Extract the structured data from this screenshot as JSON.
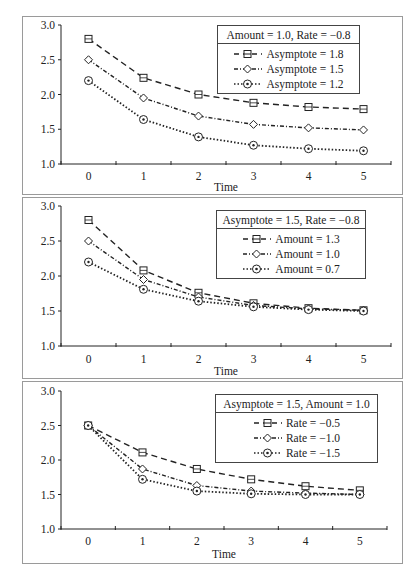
{
  "chart_data": [
    {
      "type": "line",
      "title": "",
      "legend_title": "Amount = 1.0, Rate = −0.8",
      "xlabel": "Time",
      "ylabel": "",
      "x": [
        0,
        1,
        2,
        3,
        4,
        5
      ],
      "ylim": [
        1.0,
        3.0
      ],
      "yticks": [
        "1.0",
        "1.5",
        "2.0",
        "2.5",
        "3.0"
      ],
      "grid": false,
      "legend_position": "upper right",
      "series": [
        {
          "name": "Asymptote = 1.8",
          "marker": "square",
          "dash": "dashed",
          "values": [
            2.8,
            2.24,
            2.0,
            1.88,
            1.82,
            1.79
          ]
        },
        {
          "name": "Asymptote = 1.5",
          "marker": "diamond",
          "dash": "dash-dot",
          "values": [
            2.5,
            1.95,
            1.69,
            1.57,
            1.52,
            1.49
          ]
        },
        {
          "name": "Asymptote = 1.2",
          "marker": "circle",
          "dash": "dotted",
          "values": [
            2.2,
            1.64,
            1.39,
            1.27,
            1.22,
            1.19
          ]
        }
      ]
    },
    {
      "type": "line",
      "title": "",
      "legend_title": "Asymptote = 1.5, Rate = −0.8",
      "xlabel": "Time",
      "ylabel": "",
      "x": [
        0,
        1,
        2,
        3,
        4,
        5
      ],
      "ylim": [
        1.0,
        3.0
      ],
      "yticks": [
        "1.0",
        "1.5",
        "2.0",
        "2.5",
        "3.0"
      ],
      "grid": false,
      "legend_position": "upper right",
      "series": [
        {
          "name": "Amount = 1.3",
          "marker": "square",
          "dash": "dashed",
          "values": [
            2.8,
            2.08,
            1.76,
            1.61,
            1.54,
            1.51
          ]
        },
        {
          "name": "Amount = 1.0",
          "marker": "diamond",
          "dash": "dash-dot",
          "values": [
            2.5,
            1.95,
            1.7,
            1.58,
            1.53,
            1.51
          ]
        },
        {
          "name": "Amount = 0.7",
          "marker": "circle",
          "dash": "dotted",
          "values": [
            2.2,
            1.81,
            1.64,
            1.56,
            1.52,
            1.5
          ]
        }
      ]
    },
    {
      "type": "line",
      "title": "",
      "legend_title": "Asymptote = 1.5, Amount = 1.0",
      "xlabel": "Time",
      "ylabel": "",
      "x": [
        0,
        1,
        2,
        3,
        4,
        5
      ],
      "ylim": [
        1.0,
        3.0
      ],
      "yticks": [
        "1.0",
        "1.5",
        "2.0",
        "2.5",
        "3.0"
      ],
      "grid": false,
      "legend_position": "upper right",
      "series": [
        {
          "name": "Rate = −0.5",
          "marker": "square",
          "dash": "dashed",
          "values": [
            2.5,
            2.11,
            1.87,
            1.72,
            1.62,
            1.56
          ]
        },
        {
          "name": "Rate = −1.0",
          "marker": "diamond",
          "dash": "dash-dot",
          "values": [
            2.5,
            1.87,
            1.63,
            1.55,
            1.52,
            1.5
          ]
        },
        {
          "name": "Rate = −1.5",
          "marker": "circle",
          "dash": "dotted",
          "values": [
            2.5,
            1.72,
            1.55,
            1.51,
            1.5,
            1.5
          ]
        }
      ]
    }
  ],
  "colors": {
    "line": "#222222",
    "frame": "#9a9a9a",
    "background": "#ffffff"
  }
}
